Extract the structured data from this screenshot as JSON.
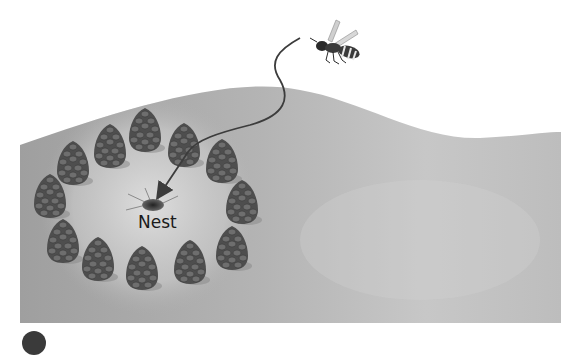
{
  "figure": {
    "type": "illustration",
    "labels": {
      "nest": "Nest"
    },
    "elements": {
      "insect": "wasp",
      "landmarks": "pinecones",
      "landmark_count": 12,
      "path": "curved flight path with arrow to nest"
    },
    "step_marker": {
      "shape": "filled circle",
      "color": "#3a3a3a"
    },
    "colors": {
      "ground": "#a9a9a9",
      "ground_light": "#d6d6d6",
      "pinecone": "#5a5a5a",
      "path": "#3c3c3c",
      "background": "#ffffff"
    }
  }
}
